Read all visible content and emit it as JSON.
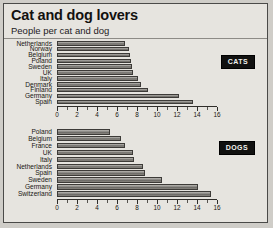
{
  "header": {
    "title": "Cat and dog lovers",
    "subtitle": "People per cat and dog"
  },
  "panels": [
    {
      "key": "cats",
      "badge": "CATS"
    },
    {
      "key": "dogs",
      "badge": "DOGS"
    }
  ],
  "axis": {
    "ticks": [
      "0",
      "2",
      "4",
      "6",
      "8",
      "10",
      "12",
      "14",
      "16"
    ],
    "min": 0,
    "max": 16,
    "step": 2
  },
  "chart_data": [
    {
      "type": "bar",
      "orientation": "horizontal",
      "title": "Cat and dog lovers",
      "subtitle": "People per cat and dog",
      "series_name": "CATS",
      "xlabel": "People per cat",
      "ylabel": "",
      "xlim": [
        0,
        16
      ],
      "xticks": [
        0,
        2,
        4,
        6,
        8,
        10,
        12,
        14,
        16
      ],
      "grid": false,
      "legend": "CATS",
      "legend_position": "top-right",
      "categories": [
        "Netherlands",
        "Norway",
        "Belgium",
        "Poland",
        "Sweden",
        "UK",
        "Italy",
        "Denmark",
        "Finland",
        "Germany",
        "Spain"
      ],
      "values": [
        6.8,
        7.2,
        7.3,
        7.4,
        7.5,
        7.6,
        8.1,
        8.4,
        9.1,
        12.2,
        13.6
      ]
    },
    {
      "type": "bar",
      "orientation": "horizontal",
      "series_name": "DOGS",
      "xlabel": "People per dog",
      "ylabel": "",
      "xlim": [
        0,
        16
      ],
      "xticks": [
        0,
        2,
        4,
        6,
        8,
        10,
        12,
        14,
        16
      ],
      "grid": false,
      "legend": "DOGS",
      "legend_position": "top-right",
      "categories": [
        "Poland",
        "Belgium",
        "France",
        "UK",
        "Italy",
        "Netherlands",
        "Spain",
        "Sweden",
        "Germany",
        "Switzerland"
      ],
      "values": [
        5.3,
        6.4,
        6.8,
        7.6,
        7.7,
        8.6,
        8.8,
        10.5,
        14.1,
        15.4
      ]
    }
  ]
}
